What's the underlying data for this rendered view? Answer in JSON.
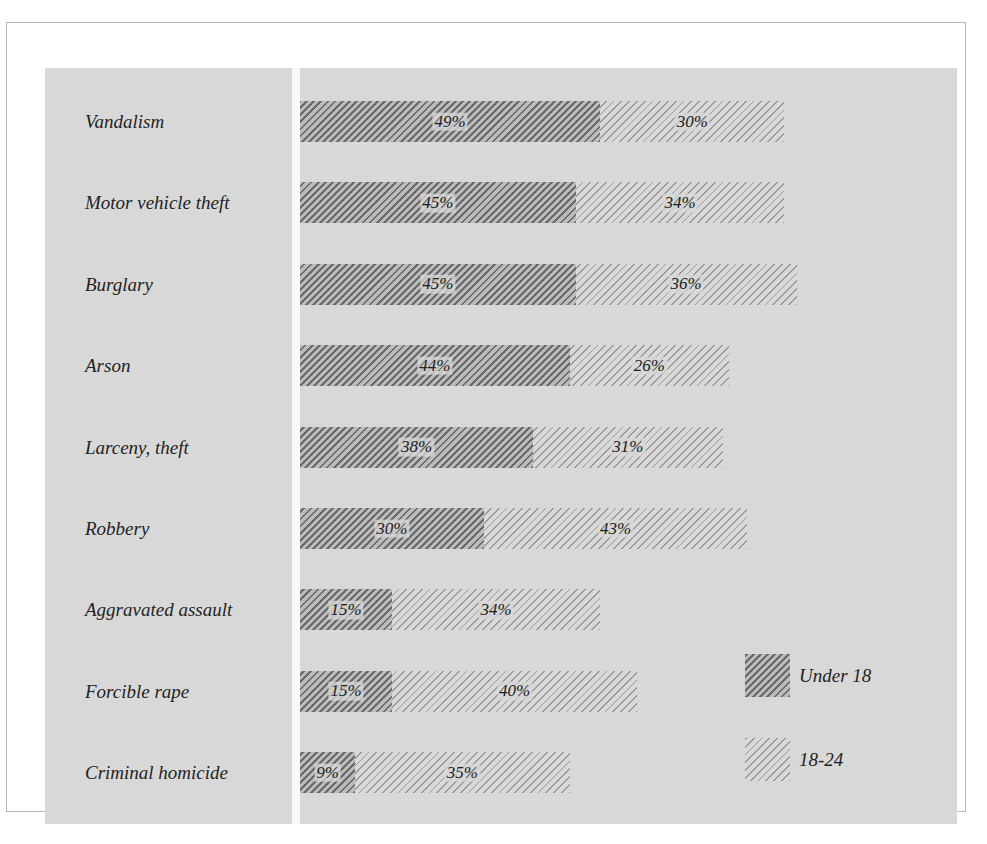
{
  "chart_data": {
    "type": "bar",
    "orientation": "horizontal",
    "stacked": true,
    "title": "",
    "subtitle": "",
    "xlabel": "",
    "ylabel": "",
    "grid": false,
    "legend_position": "right-bottom",
    "xlim": [
      0,
      100
    ],
    "value_unit": "%",
    "categories": [
      "Vandalism",
      "Motor vehicle theft",
      "Burglary",
      "Arson",
      "Larceny, theft",
      "Robbery",
      "Aggravated assault",
      "Forcible rape",
      "Criminal homicide"
    ],
    "series": [
      {
        "name": "Under 18",
        "color": "#9d9d9d",
        "hatch": "dense-diagonal",
        "values": [
          49,
          45,
          45,
          44,
          38,
          30,
          15,
          15,
          9
        ],
        "labels": [
          "49%",
          "45%",
          "45%",
          "44%",
          "38%",
          "30%",
          "15%",
          "15%",
          "9%"
        ]
      },
      {
        "name": "18-24",
        "color": "#cdcdcd",
        "hatch": "fine-diagonal",
        "values": [
          30,
          34,
          36,
          26,
          31,
          43,
          34,
          40,
          35
        ],
        "labels": [
          "30%",
          "34%",
          "36%",
          "26%",
          "31%",
          "43%",
          "34%",
          "40%",
          "35%"
        ]
      }
    ],
    "totals": [
      79,
      79,
      81,
      70,
      69,
      73,
      49,
      55,
      44
    ]
  },
  "legend": {
    "items": [
      {
        "label": "Under 18",
        "swatch": "under-18-swatch"
      },
      {
        "label": "18-24",
        "swatch": "18-24-swatch"
      }
    ]
  },
  "colors": {
    "page_background": "#ffffff",
    "panel_background": "#d9d9d9",
    "frame_border": "#b9b9b9",
    "axis_gutter": "#fbfbfb",
    "under_18": "#9d9d9d",
    "age_18_24": "#cdcdcd",
    "text": "#1c1c1c"
  }
}
